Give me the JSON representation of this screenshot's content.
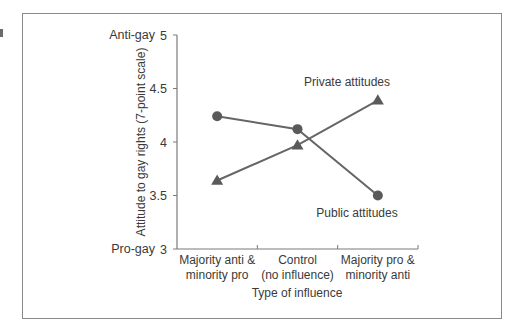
{
  "chart_data": {
    "type": "line",
    "title": "",
    "xlabel": "Type of influence",
    "ylabel": "Attitude to gay rights (7-point scale)",
    "ylim": [
      3,
      5
    ],
    "yticks": [
      "3",
      "3.5",
      "4",
      "4.5",
      "5"
    ],
    "y_extreme_labels": {
      "top": "Anti-gay",
      "bottom": "Pro-gay"
    },
    "grid": false,
    "legend": "inline annotations",
    "categories": [
      [
        "Majority anti &",
        "minority pro"
      ],
      [
        "Control",
        "(no influence)"
      ],
      [
        "Majority pro &",
        "minority anti"
      ]
    ],
    "series": [
      {
        "name": "Public attitudes",
        "marker": "circle",
        "values": [
          4.24,
          4.12,
          3.5
        ]
      },
      {
        "name": "Private attitudes",
        "marker": "triangle",
        "values": [
          3.64,
          3.97,
          4.39
        ]
      }
    ],
    "colors": {
      "line": "#666666",
      "marker": "#5a5a5a",
      "axis": "#7a7a7a",
      "frame": "#8a8a8a"
    }
  }
}
